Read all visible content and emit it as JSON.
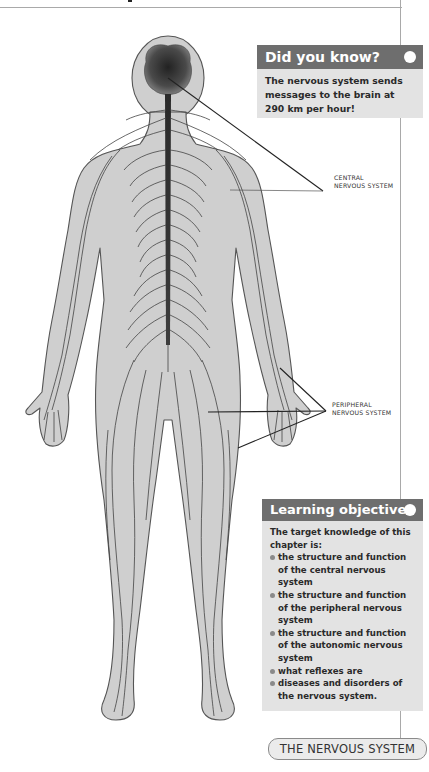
{
  "did_you_know": {
    "title": "Did you know?",
    "text": "The nervous system sends messages to the brain at 290 km per hour!"
  },
  "diagram": {
    "labels": {
      "central": "CENTRAL NERVOUS SYSTEM",
      "peripheral": "PERIPHERAL NERVOUS SYSTEM"
    }
  },
  "learning_objectives": {
    "title": "Learning objectives",
    "intro": "The target knowledge of this chapter is:",
    "items": [
      "the structure and function of the central nervous system",
      "the structure and function of the peripheral nervous system",
      "the structure and function of the autonomic nervous system",
      "what reflexes are",
      "diseases and disorders of the nervous system."
    ]
  },
  "chapter_tab": "THE NERVOUS SYSTEM",
  "colors": {
    "header_bg": "#6e6e6e",
    "box_bg": "#e3e3e3",
    "body_fill": "#cfcfcf",
    "outline": "#555555"
  }
}
